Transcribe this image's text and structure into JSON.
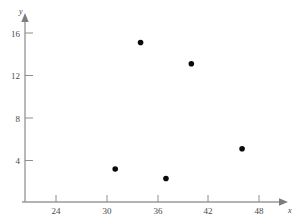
{
  "chart_data": {
    "type": "scatter",
    "title": "",
    "xlabel": "x",
    "ylabel": "y",
    "grid": false,
    "legend": null,
    "xlim": [
      20,
      51
    ],
    "ylim": [
      0,
      17.5
    ],
    "xticks": [
      24,
      30,
      36,
      42,
      48
    ],
    "yticks": [
      4,
      8,
      12,
      16
    ],
    "xtick_labels": [
      "24",
      "30",
      "36",
      "42",
      "48"
    ],
    "ytick_labels": [
      "4",
      "8",
      "12",
      "16"
    ],
    "points": [
      {
        "x": 31,
        "y": 3.2
      },
      {
        "x": 34,
        "y": 15.1
      },
      {
        "x": 37,
        "y": 2.3
      },
      {
        "x": 40,
        "y": 13.1
      },
      {
        "x": 46,
        "y": 5.1
      }
    ],
    "marker": "filled-circle",
    "marker_color": "#0a0a0a",
    "marker_size": 5,
    "axis_color": "#9a9a9a",
    "label_color": "#4a4a4a",
    "background": "#ffffff"
  },
  "axis": {
    "x_name": "x",
    "y_name": "y"
  }
}
